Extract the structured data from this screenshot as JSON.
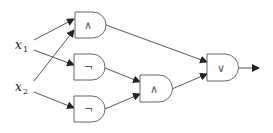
{
  "diagram": {
    "type": "logic-circuit",
    "inputs": [
      {
        "id": "x1",
        "label": "x",
        "subscript": "1"
      },
      {
        "id": "x2",
        "label": "x",
        "subscript": "2"
      }
    ],
    "gates": [
      {
        "id": "g1",
        "symbol": "∧",
        "op": "AND",
        "inputs": [
          "x1",
          "x2"
        ]
      },
      {
        "id": "g2",
        "symbol": "¬",
        "op": "NOT",
        "inputs": [
          "x1"
        ]
      },
      {
        "id": "g3",
        "symbol": "¬",
        "op": "NOT",
        "inputs": [
          "x2"
        ]
      },
      {
        "id": "g4",
        "symbol": "∧",
        "op": "AND",
        "inputs": [
          "g2",
          "g3"
        ]
      },
      {
        "id": "g5",
        "symbol": "∨",
        "op": "OR",
        "inputs": [
          "g1",
          "g4"
        ]
      }
    ],
    "output": "g5"
  }
}
